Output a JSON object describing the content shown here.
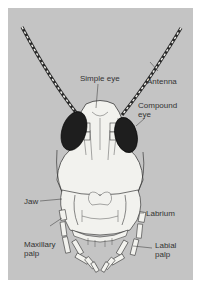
{
  "figure": {
    "colors": {
      "background": "#c4c4c4",
      "outline": "#3a3a3a",
      "body_fill": "#f2f2ee",
      "eye_fill": "#1e1e1e",
      "label_text": "#333333"
    },
    "labels": {
      "simple_eye": "Simple eye",
      "antenna": "Antenna",
      "compound_eye_1": "Compound",
      "compound_eye_2": "eye",
      "jaw": "Jaw",
      "labrium": "Labrium",
      "maxillary_palp_1": "Maxillary",
      "maxillary_palp_2": "palp",
      "labial_palp_1": "Labial",
      "labial_palp_2": "palp"
    }
  }
}
